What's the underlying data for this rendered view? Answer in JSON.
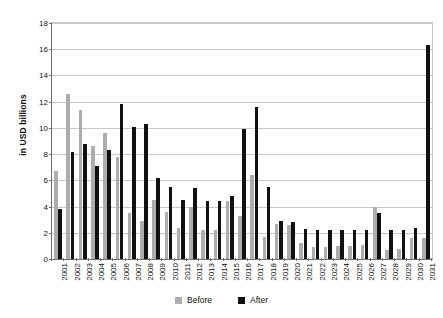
{
  "chart_data": {
    "type": "bar",
    "title": "",
    "xlabel": "",
    "ylabel": "in USD billions",
    "ylim": [
      0,
      18
    ],
    "ytick_step": 2,
    "yticks": [
      "0",
      "2",
      "4",
      "6",
      "8",
      "10",
      "12",
      "14",
      "16",
      "18"
    ],
    "grid": true,
    "legend_position": "bottom",
    "colors": {
      "before": "#adadad",
      "after": "#111111"
    },
    "categories": [
      "2001",
      "2002",
      "2003",
      "2004",
      "2005",
      "2006",
      "2007",
      "2008",
      "2009",
      "2010",
      "2011",
      "2012",
      "2013",
      "2014",
      "2015",
      "2016",
      "2017",
      "2018",
      "2019",
      "2020",
      "2021",
      "2022",
      "2023",
      "2024",
      "2025",
      "2026",
      "2027",
      "2028",
      "2029",
      "2030",
      "2031"
    ],
    "series": [
      {
        "name": "Before",
        "values": [
          6.7,
          12.6,
          11.4,
          8.6,
          9.6,
          7.8,
          3.5,
          2.9,
          4.5,
          3.6,
          2.4,
          4.0,
          2.2,
          2.2,
          4.4,
          3.3,
          6.4,
          1.7,
          2.7,
          2.6,
          1.2,
          0.9,
          0.9,
          1.0,
          1.0,
          1.1,
          4.0,
          0.7,
          0.8,
          1.6,
          1.6
        ]
      },
      {
        "name": "After",
        "values": [
          3.8,
          8.2,
          8.8,
          7.1,
          8.3,
          11.8,
          10.1,
          10.3,
          6.2,
          5.5,
          4.5,
          5.4,
          4.4,
          4.4,
          4.8,
          9.9,
          11.6,
          5.5,
          2.9,
          2.8,
          2.3,
          2.2,
          2.2,
          2.2,
          2.2,
          2.2,
          3.5,
          2.2,
          2.2,
          2.4,
          16.3
        ]
      }
    ]
  },
  "legend": {
    "items": [
      {
        "label": "Before",
        "key": "before"
      },
      {
        "label": "After",
        "key": "after"
      }
    ]
  }
}
